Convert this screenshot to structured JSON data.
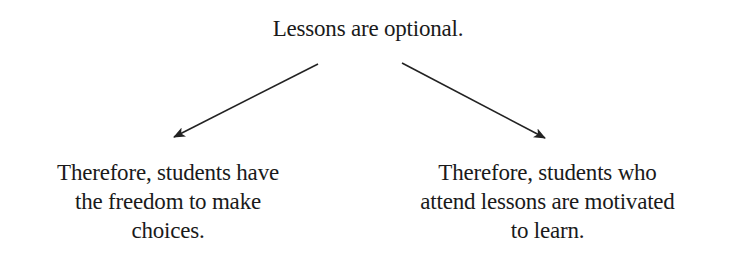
{
  "premise": "Lessons are optional.",
  "conclusions": [
    {
      "lines": [
        "Therefore, students have",
        "the freedom to make",
        "choices."
      ]
    },
    {
      "lines": [
        "Therefore, students who",
        "attend lessons are motivated",
        "to learn."
      ]
    }
  ],
  "arrows": [
    {
      "from": "premise",
      "to": "conclusion-left",
      "color": "#222222"
    },
    {
      "from": "premise",
      "to": "conclusion-right",
      "color": "#222222"
    }
  ]
}
